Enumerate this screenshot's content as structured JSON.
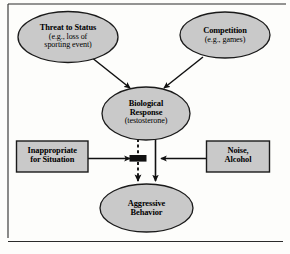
{
  "figure": {
    "kind": "causal-flow-diagram",
    "background_color": "#fdfdfb",
    "shape_fill_color": "#c9c9c9",
    "shape_stroke_color": "#1a1a1a",
    "connector_color": "#111111",
    "footer_rule_color": "#2b2b2b",
    "frame_color": "#2b2b2b"
  },
  "nodes": {
    "threat": {
      "shape": "ellipse",
      "line1": "Threat to Status",
      "line2": "(e.g., loss of",
      "line3": "sporting event)"
    },
    "competition": {
      "shape": "ellipse",
      "line1": "Competition",
      "line2": "(e.g., games)"
    },
    "biological_response": {
      "shape": "ellipse",
      "line1": "Biological",
      "line2": "Response",
      "line3": "(testosterone)"
    },
    "inappropriate": {
      "shape": "rectangle",
      "line1": "Inappropriate",
      "line2": "for Situation"
    },
    "noise_alcohol": {
      "shape": "rectangle",
      "line1": "Noise,",
      "line2": "Alcohol"
    },
    "aggressive_behavior": {
      "shape": "ellipse",
      "line1": "Aggressive",
      "line2": "Behavior"
    }
  },
  "connectors": [
    {
      "name": "threat-to-biological",
      "style": "solid",
      "from": "threat",
      "to": "biological_response",
      "arrowhead": true
    },
    {
      "name": "competition-to-biological",
      "style": "solid",
      "from": "competition",
      "to": "biological_response",
      "arrowhead": true
    },
    {
      "name": "biological-dashed-to-aggressive",
      "style": "dashed",
      "from": "biological_response",
      "to": "aggressive_behavior",
      "arrowhead": true
    },
    {
      "name": "biological-solid-to-aggressive",
      "style": "solid",
      "from": "biological_response",
      "to": "aggressive_behavior",
      "arrowhead": true
    },
    {
      "name": "inappropriate-to-junction",
      "style": "solid",
      "from": "inappropriate",
      "to": "inhibition-bar",
      "arrowhead": true
    },
    {
      "name": "noise-alcohol-to-pathway",
      "style": "solid",
      "from": "noise_alcohol",
      "to": "biological-solid-to-aggressive",
      "arrowhead": true
    }
  ],
  "markers": {
    "inhibition_bar": {
      "name": "inhibition-bar",
      "description": "solid black blocking bar on dashed pathway"
    }
  }
}
